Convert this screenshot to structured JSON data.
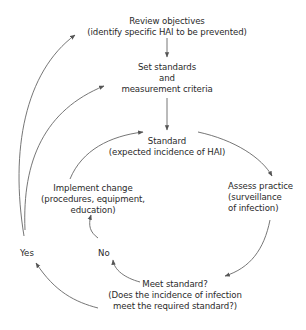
{
  "diagram": {
    "type": "cycle-flowchart",
    "nodes": {
      "review": {
        "line1": "Review objectives",
        "line2": "(identify specific HAI to be prevented)"
      },
      "set_standards": {
        "line1": "Set standards",
        "line2": "and",
        "line3": "measurement criteria"
      },
      "standard": {
        "line1": "Standard",
        "line2": "(expected incidence of HAI)"
      },
      "assess": {
        "line1": "Assess practice",
        "line2": "(surveillance",
        "line3": "of infection)"
      },
      "meet": {
        "line1": "Meet standard?",
        "line2": "(Does the incidence of infection",
        "line3": "meet the required standard?)"
      },
      "implement": {
        "line1": "Implement change",
        "line2": "(procedures, equipment,",
        "line3": "education)"
      }
    },
    "branch_labels": {
      "yes": "Yes",
      "no": "No"
    },
    "edges": [
      {
        "from": "review",
        "to": "set_standards"
      },
      {
        "from": "set_standards",
        "to": "standard"
      },
      {
        "from": "standard",
        "to": "assess"
      },
      {
        "from": "assess",
        "to": "meet"
      },
      {
        "from": "meet",
        "to": "no",
        "label": "No"
      },
      {
        "from": "no",
        "to": "implement"
      },
      {
        "from": "implement",
        "to": "standard"
      },
      {
        "from": "meet",
        "to": "yes",
        "label": "Yes"
      },
      {
        "from": "yes",
        "to": "review"
      },
      {
        "from": "yes",
        "to": "set_standards"
      }
    ],
    "colors": {
      "line": "#555555",
      "text": "#2a2a2a",
      "background": "#ffffff"
    }
  }
}
